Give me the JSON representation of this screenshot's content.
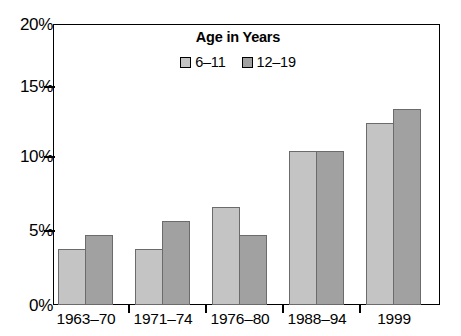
{
  "chart_data": {
    "type": "bar",
    "title": "",
    "subtitle": "",
    "xlabel": "",
    "ylabel": "",
    "categories": [
      "1963–70",
      "1971–74",
      "1976–80",
      "1988–94",
      "1999"
    ],
    "series": [
      {
        "name": "6–11",
        "values": [
          4,
          4,
          7,
          11,
          13
        ],
        "color": "#c4c4c4"
      },
      {
        "name": "12–19",
        "values": [
          5,
          6,
          5,
          11,
          14
        ],
        "color": "#a1a1a1"
      }
    ],
    "ylim": [
      0,
      20
    ],
    "ytick_values": [
      0,
      5,
      10,
      15,
      20
    ],
    "ytick_labels": [
      "0%",
      "5%",
      "10%",
      "15%",
      "20%"
    ],
    "grid": false,
    "legend_position": "inside-top-center",
    "legend_title": "Age in Years",
    "bar_border_color": "#6b6b6b",
    "axis_color": "#000000"
  },
  "legend": {
    "title": "Age in Years",
    "entries": [
      {
        "label": "6–11",
        "swatch": "legend-swatch-6-11"
      },
      {
        "label": "12–19",
        "swatch": "legend-swatch-12-19"
      }
    ]
  },
  "y_axis": {
    "labels": [
      "20%",
      "15%",
      "10%",
      "5%",
      "0%"
    ]
  },
  "x_axis": {
    "labels": [
      "1963–70",
      "1971–74",
      "1976–80",
      "1988–94",
      "1999"
    ]
  }
}
